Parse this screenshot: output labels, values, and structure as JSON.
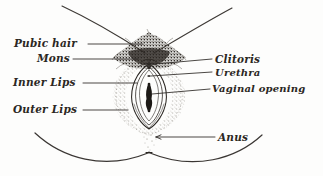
{
  "figure": {
    "style": "hand-drawn pen and ink line art with stippling",
    "background_color": "#fdfdfc",
    "ink_color": "#2b2723",
    "width": 323,
    "height": 176
  },
  "labels": {
    "pubic_hair": "Pubic hair",
    "mons": "Mons",
    "inner_lips": "Inner Lips",
    "outer_lips": "Outer Lips",
    "clitoris": "Clitoris",
    "urethra": "Urethra",
    "vaginal_opening": "Vaginal opening",
    "anus": "Anus"
  },
  "label_list": [
    {
      "name": "pubic-hair",
      "text": "Pubic hair",
      "side": "left",
      "x": 14,
      "y": 38
    },
    {
      "name": "mons",
      "text": "Mons",
      "side": "left",
      "x": 37,
      "y": 53
    },
    {
      "name": "inner-lips",
      "text": "Inner Lips",
      "side": "left",
      "x": 13,
      "y": 77
    },
    {
      "name": "outer-lips",
      "text": "Outer Lips",
      "side": "left",
      "x": 13,
      "y": 104
    },
    {
      "name": "clitoris",
      "text": "Clitoris",
      "side": "right",
      "x": 215,
      "y": 54
    },
    {
      "name": "urethra",
      "text": "Urethra",
      "side": "right",
      "x": 215,
      "y": 68
    },
    {
      "name": "vaginal-opening",
      "text": "Vaginal opening",
      "side": "right",
      "x": 212,
      "y": 84
    },
    {
      "name": "anus",
      "text": "Anus",
      "side": "right",
      "x": 218,
      "y": 132
    }
  ],
  "drawing_parts": [
    "left-thigh-crease-line",
    "right-thigh-crease-line",
    "pubic-hair-stipple-triangle",
    "outer-labia-stipple-outline",
    "inner-labia-contours",
    "vaginal-opening-slit",
    "clitoral-hood",
    "left-buttock-curve",
    "right-buttock-curve",
    "anus-marking"
  ]
}
